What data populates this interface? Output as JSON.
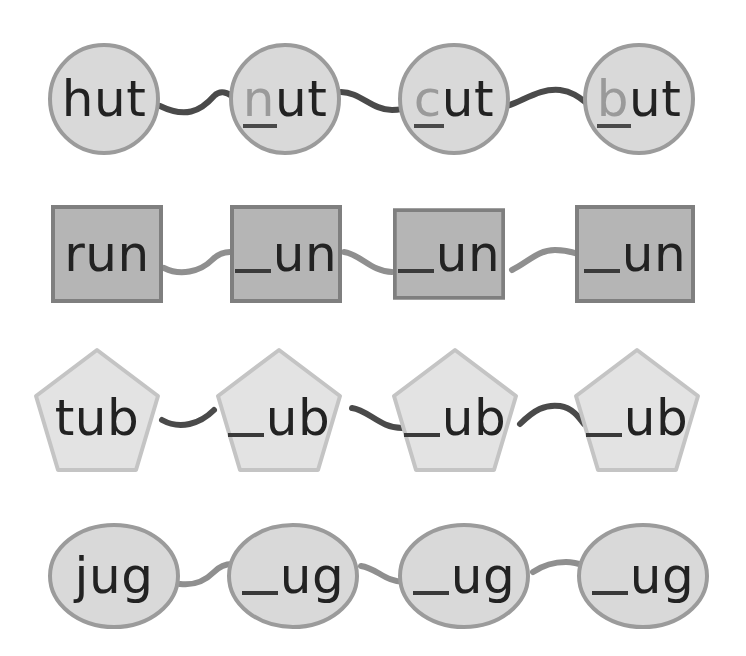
{
  "worksheet": {
    "title": "",
    "colors": {
      "background": "#ffffff",
      "shape_fill": "#d9d9d9",
      "shape_stroke": "#9b9b9b",
      "square_fill": "#b5b5b5",
      "square_stroke": "#7f7f7f",
      "pentagon_fill": "#e3e3e3",
      "pentagon_stroke": "#c4c4c4",
      "connector_dark": "#4a4a4a",
      "connector_light": "#8f8f8f",
      "text": "#222222",
      "onset_text": "#9a9a9a"
    },
    "rows": [
      {
        "shape": "circle",
        "family": "ut",
        "items": [
          {
            "onset": "",
            "rime": "hut",
            "full": "hut",
            "filled": true,
            "highlight_onset": false
          },
          {
            "onset": "n",
            "rime": "ut",
            "full": "nut",
            "filled": true,
            "highlight_onset": true
          },
          {
            "onset": "c",
            "rime": "ut",
            "full": "cut",
            "filled": true,
            "highlight_onset": true
          },
          {
            "onset": "b",
            "rime": "ut",
            "full": "but",
            "filled": true,
            "highlight_onset": true
          }
        ]
      },
      {
        "shape": "square",
        "family": "un",
        "items": [
          {
            "onset": "",
            "rime": "run",
            "full": "run",
            "filled": true
          },
          {
            "onset": "_",
            "rime": "un",
            "full": "_un",
            "filled": false
          },
          {
            "onset": "_",
            "rime": "un",
            "full": "_un",
            "filled": false
          },
          {
            "onset": "_",
            "rime": "un",
            "full": "_un",
            "filled": false
          }
        ]
      },
      {
        "shape": "pentagon",
        "family": "ub",
        "items": [
          {
            "onset": "",
            "rime": "tub",
            "full": "tub",
            "filled": true
          },
          {
            "onset": "_",
            "rime": "ub",
            "full": "_ub",
            "filled": false
          },
          {
            "onset": "_",
            "rime": "ub",
            "full": "_ub",
            "filled": false
          },
          {
            "onset": "_",
            "rime": "ub",
            "full": "_ub",
            "filled": false
          }
        ]
      },
      {
        "shape": "ellipse",
        "family": "ug",
        "items": [
          {
            "onset": "",
            "rime": "jug",
            "full": "jug",
            "filled": true
          },
          {
            "onset": "_",
            "rime": "ug",
            "full": "_ug",
            "filled": false
          },
          {
            "onset": "_",
            "rime": "ug",
            "full": "_ug",
            "filled": false
          },
          {
            "onset": "_",
            "rime": "ug",
            "full": "_ug",
            "filled": false
          }
        ]
      }
    ]
  }
}
